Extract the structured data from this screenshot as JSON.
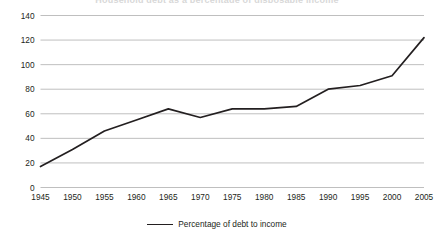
{
  "chart_data": {
    "type": "line",
    "title": "Household debt as a percentage of disposable income",
    "xlabel": "",
    "ylabel": "",
    "x": [
      1945,
      1950,
      1955,
      1960,
      1965,
      1970,
      1975,
      1980,
      1985,
      1990,
      1995,
      2000,
      2005
    ],
    "categories": [
      "1945",
      "1950",
      "1955",
      "1960",
      "1965",
      "1970",
      "1975",
      "1980",
      "1985",
      "1990",
      "1995",
      "2000",
      "2005"
    ],
    "series": [
      {
        "name": "Percentage of debt to income",
        "values": [
          17,
          31,
          46,
          55,
          64,
          57,
          64,
          64,
          66,
          80,
          83,
          91,
          122
        ]
      }
    ],
    "yticks": [
      0,
      20,
      40,
      60,
      80,
      100,
      120,
      140
    ],
    "ytick_labels": [
      "0",
      "20",
      "40",
      "60",
      "80",
      "100",
      "120",
      "140"
    ],
    "ylim": [
      0,
      140
    ],
    "xlim": [
      1945,
      2005
    ],
    "grid": "horizontal",
    "legend_position": "bottom",
    "line_color": "#231f20",
    "grid_color": "#bfbfbf",
    "background_color": "#ffffff"
  },
  "legend": {
    "entries": [
      {
        "label": "Percentage of debt to income",
        "swatch": "line-swatch"
      }
    ]
  }
}
